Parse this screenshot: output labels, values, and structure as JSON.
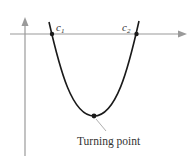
{
  "diagram": {
    "type": "parabola-graph",
    "labels": {
      "root1": "c",
      "root1_sub": "1",
      "root2": "c",
      "root2_sub": "2",
      "turning_point": "Turning point"
    },
    "colors": {
      "axis": "#9a9a9a",
      "curve": "#1a1a1a",
      "leader": "#9a9a9a",
      "text": "#333333"
    }
  }
}
